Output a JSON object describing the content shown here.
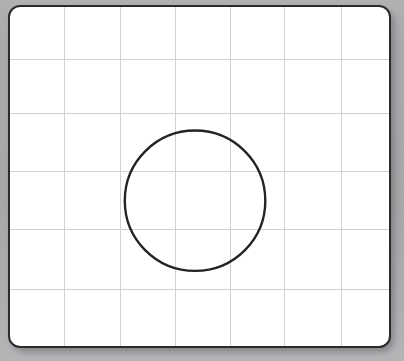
{
  "document": {
    "title": "Grid Sketch Canvas",
    "surface_label": "graph-paper-sheet"
  },
  "canvas": {
    "width": 404,
    "height": 361,
    "background_color": "#a8a9ab"
  },
  "sheet": {
    "left": 8,
    "top": 5,
    "width": 383,
    "height": 343,
    "fill_color": "#ffffff",
    "border_color": "#2b2b2d",
    "border_width": 2,
    "corner_radius": 12,
    "shadow_color": "#3c3c3e"
  },
  "grid": {
    "line_color": "#cfd0d2",
    "line_width": 1,
    "columns": 7,
    "rows": 6,
    "vertical_line_x": [
      55,
      111,
      167,
      222,
      277,
      334
    ],
    "horizontal_line_y": [
      53,
      107,
      166,
      225,
      285
    ],
    "cell_width": 56,
    "cell_height": 56
  },
  "shapes": [
    {
      "name": "circle-outline",
      "type": "circle",
      "center_x": 187,
      "center_y": 196,
      "radius": 71,
      "stroke_color": "#242426",
      "stroke_width": 2.4,
      "fill": "none"
    }
  ],
  "chart_data": {
    "type": "scatter",
    "title": "",
    "xlabel": "",
    "ylabel": "",
    "grid": true,
    "legend_position": "none",
    "xlim": [
      0,
      7
    ],
    "ylim": [
      0,
      6
    ],
    "annotations": [
      {
        "kind": "circle",
        "center": [
          3.34,
          3.5
        ],
        "radius": 1.27,
        "stroke": "#242426",
        "fill": "none"
      }
    ]
  }
}
